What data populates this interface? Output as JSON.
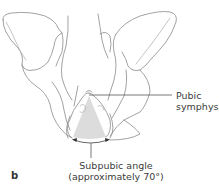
{
  "figure": {
    "panel_letter": "b",
    "labels": {
      "pubic_symphysis_line1": "Pubic",
      "pubic_symphysis_line2": "symphysis",
      "subpubic_line1": "Subpubic angle",
      "subpubic_line2": "(approximately 70°)"
    },
    "colors": {
      "outline": "#8a8a8a",
      "fill_angle": "#dcdcdc",
      "leader_line": "#555555",
      "text": "#3c3c3c"
    }
  }
}
